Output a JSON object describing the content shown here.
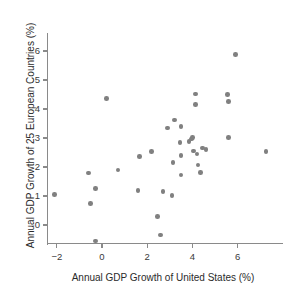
{
  "chart_data": {
    "type": "scatter",
    "title": "",
    "xlabel": "Annual GDP Growth of United States (%)",
    "ylabel": "Annual GDP Growth of 25 European Countries (%)",
    "xlim": [
      -2.9,
      7.7
    ],
    "ylim": [
      -0.9,
      6.5
    ],
    "xticks": [
      -2,
      0,
      2,
      4,
      6
    ],
    "xticklabels": [
      "−2",
      "0",
      "2",
      "4",
      "6"
    ],
    "yticks": [
      0,
      1,
      2,
      3,
      4,
      5,
      6
    ],
    "yticklabels": [
      "0",
      "1",
      "2",
      "3",
      "4",
      "5",
      "6"
    ],
    "grid": false,
    "legend": null,
    "marker_color": "#808080",
    "axis_color": "#8a8a8a",
    "points": [
      {
        "x": -2.1,
        "y": 1.05
      },
      {
        "x": -0.6,
        "y": 1.8
      },
      {
        "x": -0.5,
        "y": 0.75
      },
      {
        "x": -0.3,
        "y": 1.25
      },
      {
        "x": -0.3,
        "y": -0.55
      },
      {
        "x": 0.2,
        "y": 4.37
      },
      {
        "x": 0.7,
        "y": 1.9
      },
      {
        "x": 1.65,
        "y": 2.37
      },
      {
        "x": 1.6,
        "y": 1.18
      },
      {
        "x": 2.2,
        "y": 2.53
      },
      {
        "x": 2.45,
        "y": 0.3
      },
      {
        "x": 2.6,
        "y": -0.35
      },
      {
        "x": 2.7,
        "y": 1.15
      },
      {
        "x": 2.9,
        "y": 3.35
      },
      {
        "x": 3.1,
        "y": 1.02
      },
      {
        "x": 3.15,
        "y": 2.15
      },
      {
        "x": 3.2,
        "y": 3.62
      },
      {
        "x": 3.45,
        "y": 2.85
      },
      {
        "x": 3.5,
        "y": 3.4
      },
      {
        "x": 3.5,
        "y": 2.4
      },
      {
        "x": 3.5,
        "y": 1.73
      },
      {
        "x": 3.85,
        "y": 2.88
      },
      {
        "x": 3.95,
        "y": 2.97
      },
      {
        "x": 4.0,
        "y": 3.02
      },
      {
        "x": 4.05,
        "y": 2.55
      },
      {
        "x": 4.15,
        "y": 4.52
      },
      {
        "x": 4.15,
        "y": 4.15
      },
      {
        "x": 4.2,
        "y": 2.45
      },
      {
        "x": 4.25,
        "y": 2.07
      },
      {
        "x": 4.35,
        "y": 1.82
      },
      {
        "x": 4.45,
        "y": 2.65
      },
      {
        "x": 4.6,
        "y": 2.6
      },
      {
        "x": 5.55,
        "y": 4.5
      },
      {
        "x": 5.6,
        "y": 4.25
      },
      {
        "x": 5.6,
        "y": 3.02
      },
      {
        "x": 5.9,
        "y": 5.87
      },
      {
        "x": 7.25,
        "y": 2.53
      }
    ]
  }
}
